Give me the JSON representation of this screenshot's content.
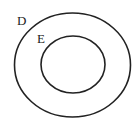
{
  "diagram": {
    "type": "nested-sets",
    "sets": [
      {
        "label": "D",
        "cx": 72.5,
        "cy": 65,
        "rx": 58,
        "ry": 52,
        "label_x": 17,
        "label_y": 25
      },
      {
        "label": "E",
        "cx": 73,
        "cy": 64.5,
        "rx": 32,
        "ry": 28.5,
        "label_x": 37,
        "label_y": 43
      }
    ],
    "colors": {
      "stroke": "#222222",
      "background": "#ffffff"
    }
  }
}
